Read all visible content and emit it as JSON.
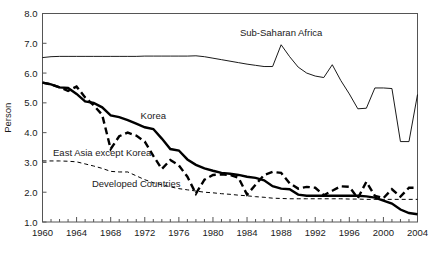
{
  "chart_data": {
    "type": "line",
    "title": "",
    "xlabel": "",
    "ylabel": "Person",
    "xlim": [
      1960,
      2004
    ],
    "ylim": [
      1.0,
      8.0
    ],
    "yticks": [
      "1.0",
      "2.0",
      "3.0",
      "4.0",
      "5.0",
      "6.0",
      "7.0",
      "8.0"
    ],
    "xticks": [
      "1960",
      "1964",
      "1968",
      "1972",
      "1976",
      "1980",
      "1984",
      "1988",
      "1992",
      "1996",
      "2000",
      "2004"
    ],
    "xtick_step": 4,
    "minor_xtick_step": 1,
    "grid": false,
    "legend": "inline-annotations",
    "x": [
      1960,
      1961,
      1962,
      1963,
      1964,
      1965,
      1966,
      1967,
      1968,
      1969,
      1970,
      1971,
      1972,
      1973,
      1974,
      1975,
      1976,
      1977,
      1978,
      1979,
      1980,
      1981,
      1982,
      1983,
      1984,
      1985,
      1986,
      1987,
      1988,
      1989,
      1990,
      1991,
      1992,
      1993,
      1994,
      1995,
      1996,
      1997,
      1998,
      1999,
      2000,
      2001,
      2002,
      2003,
      2004
    ],
    "series": [
      {
        "name": "Sub-Saharan Africa",
        "style": "thin-solid",
        "label_x": 1988,
        "label_y": 7.25,
        "values": [
          6.52,
          6.55,
          6.56,
          6.56,
          6.56,
          6.56,
          6.56,
          6.56,
          6.56,
          6.56,
          6.56,
          6.56,
          6.57,
          6.57,
          6.57,
          6.57,
          6.57,
          6.57,
          6.58,
          6.55,
          6.5,
          6.45,
          6.4,
          6.35,
          6.3,
          6.26,
          6.22,
          6.22,
          6.95,
          6.55,
          6.2,
          6.0,
          5.9,
          5.85,
          6.28,
          5.75,
          5.3,
          4.8,
          4.82,
          5.5,
          5.5,
          5.48,
          3.7,
          3.7,
          5.28
        ]
      },
      {
        "name": "Korea",
        "style": "thick-solid",
        "label_x": 1973,
        "label_y": 4.45,
        "values": [
          5.68,
          5.62,
          5.52,
          5.5,
          5.3,
          5.05,
          5.0,
          4.85,
          4.58,
          4.52,
          4.42,
          4.3,
          4.18,
          4.12,
          3.8,
          3.45,
          3.4,
          3.1,
          2.92,
          2.8,
          2.72,
          2.65,
          2.62,
          2.58,
          2.52,
          2.48,
          2.4,
          2.2,
          2.12,
          2.1,
          1.92,
          1.88,
          1.88,
          1.88,
          1.88,
          1.88,
          1.88,
          1.88,
          1.86,
          1.82,
          1.72,
          1.62,
          1.42,
          1.3,
          1.26
        ]
      },
      {
        "name": "East Asia except Korea",
        "style": "thick-dashed",
        "label_x": 1967,
        "label_y": 3.22,
        "values": [
          5.68,
          5.62,
          5.52,
          5.4,
          5.55,
          5.18,
          4.92,
          4.6,
          3.45,
          3.88,
          4.0,
          3.9,
          3.7,
          3.22,
          2.78,
          3.08,
          2.9,
          2.52,
          1.95,
          2.42,
          2.58,
          2.6,
          2.58,
          2.48,
          1.92,
          2.25,
          2.58,
          2.68,
          2.65,
          2.3,
          2.12,
          2.18,
          2.15,
          1.9,
          2.05,
          2.2,
          2.18,
          1.8,
          2.35,
          1.88,
          1.8,
          2.1,
          1.85,
          2.15,
          2.15
        ]
      },
      {
        "name": "Developed Countries",
        "style": "thin-dashed",
        "label_x": 1971,
        "label_y": 2.18,
        "values": [
          3.05,
          3.05,
          3.05,
          3.04,
          3.02,
          2.95,
          2.88,
          2.8,
          2.7,
          2.68,
          2.68,
          2.55,
          2.42,
          2.32,
          2.25,
          2.18,
          2.12,
          2.08,
          2.04,
          2.0,
          1.98,
          1.95,
          1.93,
          1.9,
          1.88,
          1.85,
          1.83,
          1.8,
          1.79,
          1.78,
          1.78,
          1.78,
          1.78,
          1.78,
          1.78,
          1.78,
          1.77,
          1.77,
          1.76,
          1.76,
          1.76,
          1.76,
          1.76,
          1.76,
          1.76
        ]
      }
    ]
  },
  "axis": {
    "y_title": "Person"
  }
}
